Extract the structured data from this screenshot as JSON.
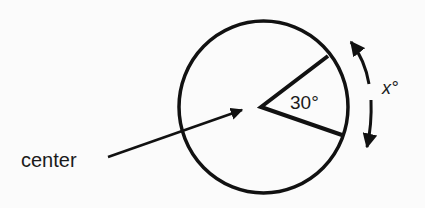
{
  "diagram": {
    "type": "circle-central-angle",
    "labels": {
      "center": "center",
      "angle": "30°",
      "arc": "x°"
    },
    "angle_degrees": 30,
    "arc_variable": "x",
    "colors": {
      "stroke": "#111111",
      "background": "#fbfbfb"
    }
  }
}
